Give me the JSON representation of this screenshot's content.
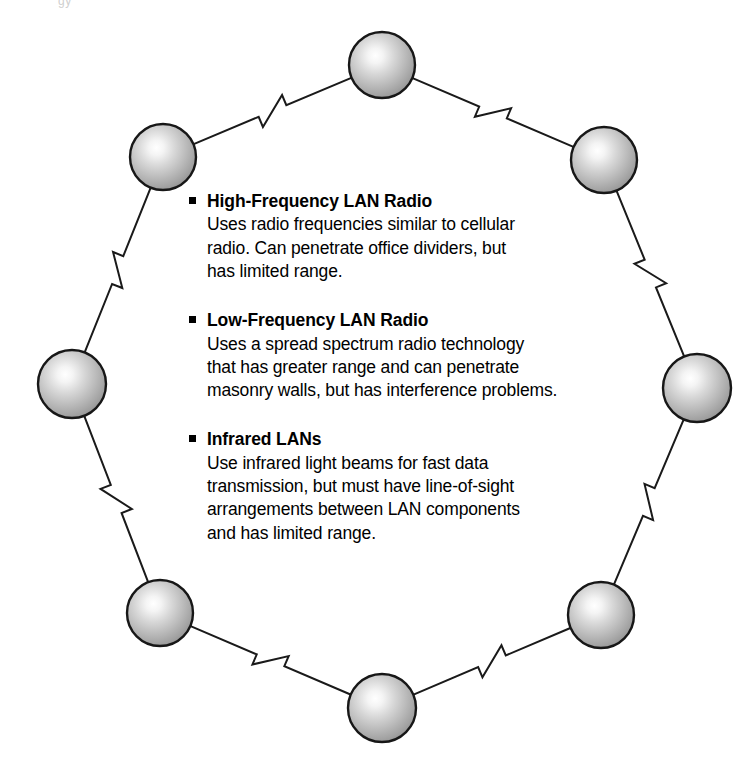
{
  "diagram": {
    "header_artifact": "gy",
    "node_count": 8,
    "node_label": "network-node",
    "colors": {
      "line": "#1a1a1a",
      "node_outline": "#171717",
      "node_highlight": "#fdfdfd",
      "node_mid": "#cfcfcf",
      "node_edge": "#8a8a8a",
      "text": "#000000",
      "background": "#ffffff"
    },
    "nodes": [
      {
        "name": "node-top",
        "cx": 382,
        "cy": 65,
        "r": 33
      },
      {
        "name": "node-upper-right",
        "cx": 604,
        "cy": 160,
        "r": 33
      },
      {
        "name": "node-right",
        "cx": 697,
        "cy": 388,
        "r": 34
      },
      {
        "name": "node-lower-right",
        "cx": 601,
        "cy": 615,
        "r": 33
      },
      {
        "name": "node-bottom",
        "cx": 382,
        "cy": 708,
        "r": 34
      },
      {
        "name": "node-lower-left",
        "cx": 160,
        "cy": 613,
        "r": 33
      },
      {
        "name": "node-left",
        "cx": 72,
        "cy": 384,
        "r": 34
      },
      {
        "name": "node-upper-left",
        "cx": 163,
        "cy": 157,
        "r": 33
      }
    ],
    "links": [
      {
        "name": "link-top-to-upper-right",
        "from": 0,
        "to": 1,
        "zigzag": true
      },
      {
        "name": "link-upper-right-to-right",
        "from": 1,
        "to": 2,
        "zigzag": true
      },
      {
        "name": "link-right-to-lower-right",
        "from": 2,
        "to": 3,
        "zigzag": true
      },
      {
        "name": "link-lower-right-to-bottom",
        "from": 3,
        "to": 4,
        "zigzag": true
      },
      {
        "name": "link-bottom-to-lower-left",
        "from": 4,
        "to": 5,
        "zigzag": true
      },
      {
        "name": "link-lower-left-to-left",
        "from": 5,
        "to": 6,
        "zigzag": true
      },
      {
        "name": "link-left-to-upper-left",
        "from": 6,
        "to": 7,
        "zigzag": true
      },
      {
        "name": "link-upper-left-to-top",
        "from": 7,
        "to": 0,
        "zigzag": true
      }
    ]
  },
  "content": {
    "topics": [
      {
        "heading": "High-Frequency LAN Radio",
        "body": "Uses radio frequencies similar to cellular\nradio. Can penetrate office dividers, but\nhas limited range."
      },
      {
        "heading": "Low-Frequency LAN Radio",
        "body": "Uses a spread spectrum radio technology\nthat has greater range and can penetrate\nmasonry walls, but has interference problems."
      },
      {
        "heading": "Infrared LANs",
        "body": "Use infrared light beams for fast data\ntransmission, but must have line-of-sight\narrangements between LAN components\nand has limited range."
      }
    ]
  }
}
